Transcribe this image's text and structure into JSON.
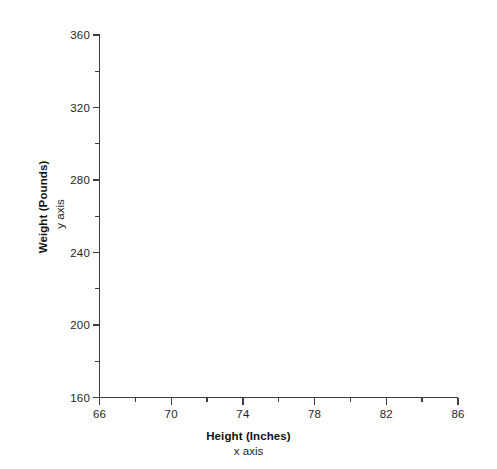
{
  "chart_data": {
    "type": "scatter",
    "title": "",
    "subtitle": "",
    "xlabel": "Height (Inches)",
    "xlabel_sub": "x axis",
    "ylabel": "Weight (Pounds)",
    "ylabel_sub": "y axis",
    "xlim": [
      66,
      86
    ],
    "ylim": [
      160,
      360
    ],
    "x_major_ticks": [
      66,
      70,
      74,
      78,
      82,
      86
    ],
    "x_minor_ticks": [
      68,
      72,
      76,
      80,
      84
    ],
    "y_major_ticks": [
      160,
      200,
      240,
      280,
      320,
      360
    ],
    "y_minor_ticks": [
      180,
      220,
      260,
      300,
      340
    ],
    "x_tick_labels": [
      "66",
      "70",
      "74",
      "78",
      "82",
      "86"
    ],
    "y_tick_labels": [
      "160",
      "200",
      "240",
      "280",
      "320",
      "360"
    ],
    "series": [
      {
        "name": "",
        "x": [],
        "y": []
      }
    ],
    "values": [],
    "categories": [],
    "grid": false,
    "legend": false,
    "legend_position": "none",
    "annotations": [],
    "background_color": "#ffffff",
    "axis_color": "#3d3d3d",
    "text_color": "#1f1f1f"
  }
}
